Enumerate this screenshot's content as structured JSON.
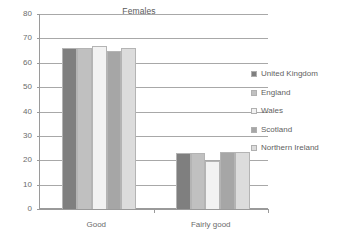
{
  "chart_data": {
    "type": "bar",
    "title": "Females",
    "xlabel": "",
    "ylabel": "",
    "ylim": [
      0,
      80
    ],
    "ytick_step": 10,
    "yticks": [
      80,
      70,
      60,
      50,
      40,
      30,
      20,
      10,
      0
    ],
    "grid": true,
    "legend_position": "right",
    "categories": [
      "Good",
      "Fairly good"
    ],
    "series": [
      {
        "name": "United Kingdom",
        "values": [
          66.0,
          23.0
        ],
        "color": "#7f7f7f"
      },
      {
        "name": "England",
        "values": [
          66.0,
          23.0
        ],
        "color": "#c0c0c0"
      },
      {
        "name": "Wales",
        "values": [
          67.0,
          19.5
        ],
        "color": "#f2f2f2"
      },
      {
        "name": "Scotland",
        "values": [
          65.0,
          23.5
        ],
        "color": "#a6a6a6"
      },
      {
        "name": "Northern Ireland",
        "values": [
          66.0,
          23.5
        ],
        "color": "#dcdcdc"
      }
    ]
  },
  "legend": {
    "items": [
      {
        "label": "United Kingdom"
      },
      {
        "label": "England"
      },
      {
        "label": "Wales"
      },
      {
        "label": "Scotland"
      },
      {
        "label": "Northern Ireland"
      }
    ]
  }
}
